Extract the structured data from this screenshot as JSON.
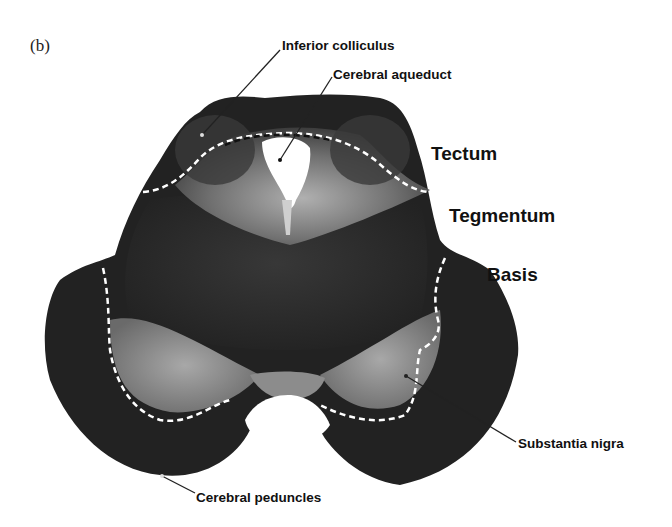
{
  "figure": {
    "panel_label": "(b)",
    "colors": {
      "background": "#ffffff",
      "tissue_dark": "#1a1a1a",
      "tissue_mid": "#4a4a4a",
      "tissue_light": "#9a9a9a",
      "aqueduct": "#ffffff",
      "dashed_boundary": "#ffffff",
      "leader_line": "#222222",
      "text": "#111111"
    },
    "labels": {
      "inferior_colliculus": "Inferior colliculus",
      "cerebral_aqueduct": "Cerebral aqueduct",
      "tectum": "Tectum",
      "tegmentum": "Tegmentum",
      "basis": "Basis",
      "substantia_nigra": "Substantia nigra",
      "cerebral_peduncles": "Cerebral peduncles"
    }
  }
}
